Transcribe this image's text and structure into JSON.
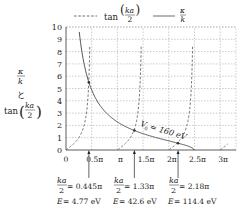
{
  "chart_data": {
    "type": "line",
    "title": "",
    "xlabel": "ka/2",
    "ylabel": "κ/k と tan(ka/2)",
    "ylabel_parts": {
      "top_num": "κ",
      "top_den": "k",
      "mid": "と",
      "bottom": "tan",
      "frac_num": "ka",
      "frac_den": "2"
    },
    "xlim_pi": [
      0,
      3.15
    ],
    "ylim": [
      0,
      10
    ],
    "grid": true,
    "x_ticks": [
      {
        "value_pi": 0,
        "label": "0"
      },
      {
        "value_pi": 0.5,
        "label": "0.5π"
      },
      {
        "value_pi": 1.0,
        "label": "π"
      },
      {
        "value_pi": 1.5,
        "label": "1.5π"
      },
      {
        "value_pi": 2.0,
        "label": "2π"
      },
      {
        "value_pi": 2.5,
        "label": "2.5π"
      },
      {
        "value_pi": 3.0,
        "label": "3π"
      }
    ],
    "y_ticks": [
      0,
      1,
      2,
      3,
      4,
      5,
      6,
      7,
      8,
      9,
      10
    ],
    "legend": {
      "position": "top",
      "entries": [
        {
          "style": "dashed",
          "label": "tan(ka/2)",
          "label_prefix": "tan",
          "frac_num": "ka",
          "frac_den": "2"
        },
        {
          "style": "solid",
          "label": "κ/k",
          "frac_num": "κ",
          "frac_den": "k"
        }
      ]
    },
    "series": [
      {
        "name": "tan(ka/2)",
        "style": "dashed",
        "function": "tan(x)",
        "branches_pi": [
          [
            0,
            0.5
          ],
          [
            1.0,
            1.5
          ],
          [
            2.0,
            2.5
          ],
          [
            3.0,
            3.15
          ]
        ]
      },
      {
        "name": "κ/k",
        "style": "solid",
        "function": "sqrt((X0/x)^2 - 1)",
        "X0_pi": 2.49,
        "points": [
          [
            0.29,
            10
          ],
          [
            0.445,
            5.5
          ],
          [
            1.0,
            2.27
          ],
          [
            1.33,
            1.58
          ],
          [
            2.0,
            0.74
          ],
          [
            2.18,
            0.55
          ],
          [
            2.49,
            0
          ]
        ]
      }
    ],
    "annotation": {
      "text_V": "V",
      "text_sub": "0",
      "text_rest": "= 160 eV",
      "label": "V0 = 160 eV"
    },
    "intersections": [
      {
        "x_pi": 0.445,
        "ka2_label": "= 0.445π",
        "E_label": "= 4.77 eV",
        "E_eV": 4.77
      },
      {
        "x_pi": 1.33,
        "ka2_label": "= 1.33π",
        "E_label": "= 42.6 eV",
        "E_eV": 42.6
      },
      {
        "x_pi": 2.18,
        "ka2_label": "= 2.18π",
        "E_label": "= 114.4 eV",
        "E_eV": 114.4
      }
    ],
    "frac_num": "ka",
    "frac_den": "2",
    "E_symbol": "E"
  }
}
